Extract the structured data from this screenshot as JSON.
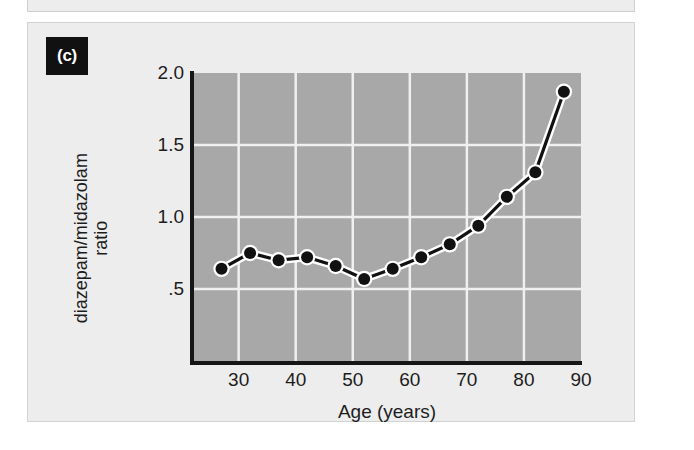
{
  "figure": {
    "panel_tag": "(c)"
  },
  "chart_data": {
    "type": "line",
    "title": "",
    "xlabel": "Age (years)",
    "ylabel": "diazepam/midazolam ratio",
    "ylabel_line1": "diazepam/midazolam",
    "ylabel_line2": "ratio",
    "xlim": [
      22,
      90
    ],
    "ylim": [
      0.0,
      2.0
    ],
    "xticks": [
      30,
      40,
      50,
      60,
      70,
      80,
      90
    ],
    "xticklabels": [
      "30",
      "40",
      "50",
      "60",
      "70",
      "80",
      "90"
    ],
    "yticks": [
      0.5,
      1.0,
      1.5,
      2.0
    ],
    "yticklabels": [
      ".5",
      "1.0",
      "1.5",
      "2.0"
    ],
    "grid": true,
    "grid_color": "#f0f0f0",
    "plot_bg": "#a8a8a8",
    "line_color": "#111111",
    "line_halo_color": "#ffffff",
    "marker_color": "#111111",
    "marker_edge_color": "#ffffff",
    "x": [
      27,
      32,
      37,
      42,
      47,
      52,
      57,
      62,
      67,
      72,
      77,
      82,
      87
    ],
    "y": [
      0.64,
      0.75,
      0.7,
      0.72,
      0.66,
      0.57,
      0.64,
      0.72,
      0.81,
      0.94,
      1.14,
      1.31,
      1.87
    ],
    "series": [
      {
        "name": "diazepam/midazolam ratio",
        "values": [
          0.64,
          0.75,
          0.7,
          0.72,
          0.66,
          0.57,
          0.64,
          0.72,
          0.81,
          0.94,
          1.14,
          1.31,
          1.87
        ]
      }
    ],
    "legend": [],
    "annotations": []
  },
  "colors": {
    "panel_bg": "#ededed",
    "panel_border": "#d2d2d2",
    "axis": "#161616",
    "text": "#1d1d1d",
    "tag_bg": "#111111",
    "tag_text": "#ffffff"
  }
}
